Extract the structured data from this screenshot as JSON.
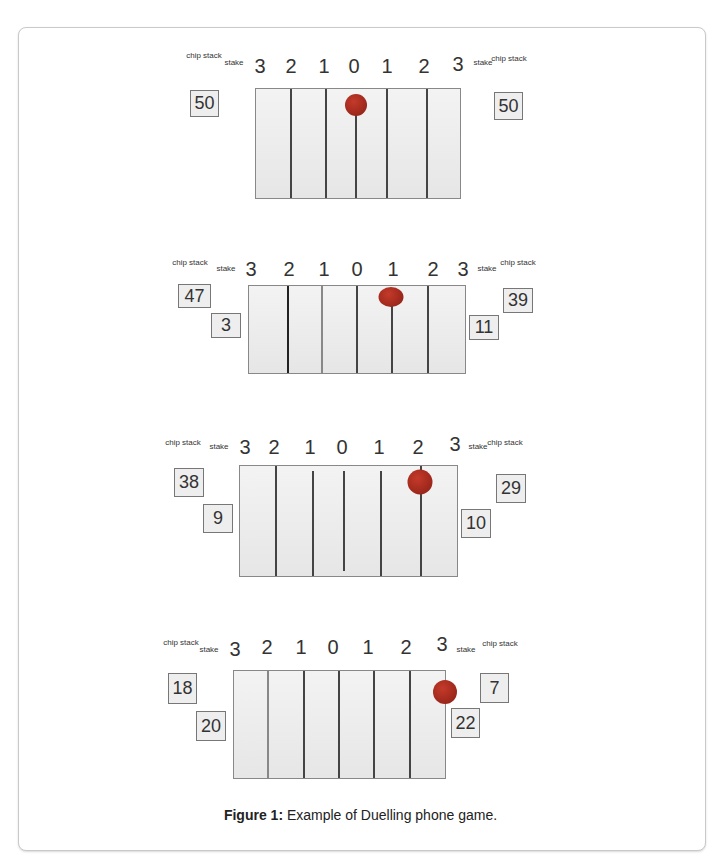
{
  "figure": {
    "caption_label": "Figure 1:",
    "caption_text": " Example of Duelling phone game."
  },
  "labels": {
    "chip_stack": "chip stack",
    "stake": "stake"
  },
  "scale": [
    "3",
    "2",
    "1",
    "0",
    "1",
    "2",
    "3"
  ],
  "panels": [
    {
      "left_chip": "50",
      "left_stake": "",
      "right_stake": "",
      "right_chip": "50",
      "ball_position": "0"
    },
    {
      "left_chip": "47",
      "left_stake": "3",
      "right_stake": "11",
      "right_chip": "39",
      "ball_position": "1 (right)"
    },
    {
      "left_chip": "38",
      "left_stake": "9",
      "right_stake": "10",
      "right_chip": "29",
      "ball_position": "2 (right)"
    },
    {
      "left_chip": "18",
      "left_stake": "20",
      "right_stake": "22",
      "right_chip": "7",
      "ball_position": "3 (right)"
    }
  ]
}
